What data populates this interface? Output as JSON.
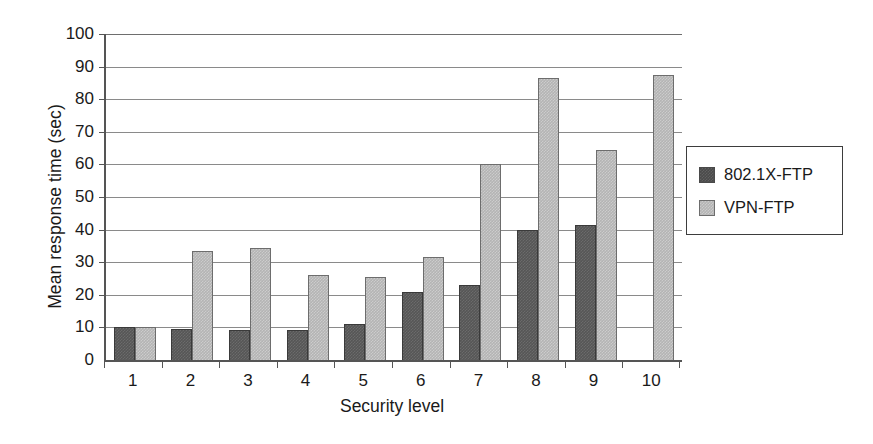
{
  "chart_data": {
    "type": "bar",
    "title": "",
    "subtitle": "",
    "xlabel": "Security level",
    "ylabel": "Mean response time (sec)",
    "categories": [
      "1",
      "2",
      "3",
      "4",
      "5",
      "6",
      "7",
      "8",
      "9",
      "10"
    ],
    "series": [
      {
        "name": "802.1X-FTP",
        "color": "#565656",
        "values": [
          10,
          9.5,
          9.3,
          9.3,
          11,
          21,
          23,
          40,
          41.5,
          null
        ]
      },
      {
        "name": "VPN-FTP",
        "color": "#b4b4b4",
        "values": [
          10,
          33.5,
          34.5,
          26,
          25.5,
          31.5,
          60,
          86.5,
          64.5,
          87.5
        ]
      }
    ],
    "ylim": [
      0,
      100
    ],
    "ytick_values": [
      0,
      10,
      20,
      30,
      40,
      50,
      60,
      70,
      80,
      90,
      100
    ],
    "ytick_labels": [
      "0",
      "10",
      "20",
      "30",
      "40",
      "50",
      "60",
      "70",
      "80",
      "90",
      "100"
    ],
    "grid": true,
    "grid_axis": "y",
    "legend_position": "right"
  },
  "legend": {
    "entries": [
      {
        "label": "802.1X-FTP",
        "swatch": "dark"
      },
      {
        "label": "VPN-FTP",
        "swatch": "light"
      }
    ]
  }
}
